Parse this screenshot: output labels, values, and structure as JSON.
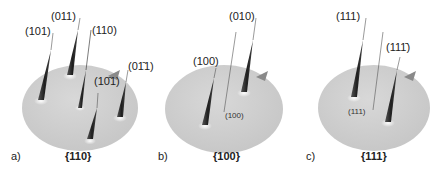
{
  "figure": {
    "panels": [
      {
        "letter": "a)",
        "plane": "{110}",
        "spike_labels": [
          "(101)",
          "(011)",
          "(110)",
          "(10̄1)",
          "(01̄1)"
        ]
      },
      {
        "letter": "b)",
        "plane": "{100}",
        "spike_labels": [
          "(100)",
          "(010)"
        ],
        "normal_label": "(100)"
      },
      {
        "letter": "c)",
        "plane": "{111}",
        "spike_labels": [
          "(111)",
          "(111̄)"
        ],
        "normal_label": "(111)"
      }
    ],
    "colors": {
      "disc": "#d3d3d3",
      "spike": "#2a2a2a",
      "highlight": "#f5f5f5",
      "text": "#222222"
    }
  }
}
